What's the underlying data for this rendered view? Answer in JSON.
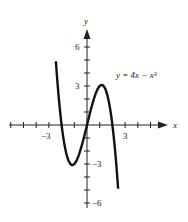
{
  "chart_data": {
    "type": "line",
    "title": "",
    "equation_label": "y = 4x − x³",
    "xlabel": "x",
    "ylabel": "y",
    "xlim": [
      -6,
      6
    ],
    "ylim": [
      -6,
      7
    ],
    "x_ticks": [
      -6,
      -5,
      -4,
      -3,
      -2,
      -1,
      1,
      2,
      3,
      4,
      5
    ],
    "x_tick_labels": [
      {
        "value": -3,
        "label": "−3"
      },
      {
        "value": 3,
        "label": "3"
      }
    ],
    "y_ticks": [
      -6,
      -5,
      -4,
      -3,
      -2,
      -1,
      1,
      2,
      3,
      4,
      5,
      6
    ],
    "y_tick_labels": [
      {
        "value": 6,
        "label": "6"
      },
      {
        "value": 3,
        "label": "3"
      },
      {
        "value": -3,
        "label": "−3"
      },
      {
        "value": -6,
        "label": "−6"
      }
    ],
    "grid": false,
    "legend": "none",
    "series": [
      {
        "name": "y = 4x − x³",
        "x": [
          -2.45,
          -2.0,
          -1.5,
          -1.155,
          -0.5,
          0,
          0.5,
          1.155,
          1.5,
          2.0,
          2.45
        ],
        "y": [
          4.91,
          0.0,
          -2.63,
          -3.08,
          -1.88,
          0.0,
          1.88,
          3.08,
          2.63,
          0.0,
          -4.91
        ]
      }
    ],
    "critical_points": [
      {
        "label": "local max",
        "x": 1.155,
        "y": 3.08
      },
      {
        "label": "local min",
        "x": -1.155,
        "y": -3.08
      }
    ]
  }
}
